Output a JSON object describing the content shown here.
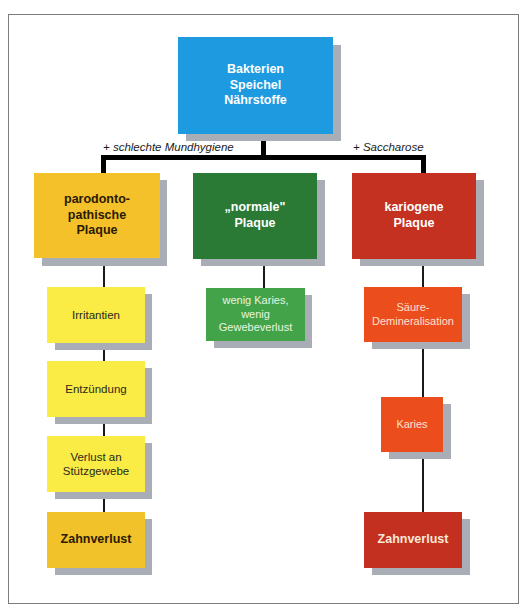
{
  "diagram": {
    "type": "flowchart",
    "colors": {
      "root": "#1d9ae0",
      "yellow_main": "#f4c12a",
      "yellow_light": "#fbeb45",
      "yellow_end": "#f2c22b",
      "green_main": "#2a7a36",
      "green_light": "#42a349",
      "red_main": "#c43120",
      "orange": "#ec4d1d",
      "red_end": "#c3301f",
      "shadow": "#a9aeb6",
      "frame": "#7c7c7c"
    },
    "root": {
      "label": "Bakterien\nSpeichel\nNährstoffe"
    },
    "edge_labels": {
      "left": "+ schlechte Mundhygiene",
      "right": "+ Saccharose"
    },
    "columns": [
      {
        "main": {
          "label": "parodonto-\npathische\nPlaque"
        },
        "steps": [
          {
            "label": "Irritantien"
          },
          {
            "label": "Entzündung"
          },
          {
            "label": "Verlust  an\nStützgewebe"
          },
          {
            "label": "Zahnverlust"
          }
        ]
      },
      {
        "main": {
          "label": "„normale\"\nPlaque"
        },
        "steps": [
          {
            "label": "wenig  Karies,\nwenig\nGewebeverlust"
          }
        ]
      },
      {
        "main": {
          "label": "kariogene\nPlaque"
        },
        "steps": [
          {
            "label": "Säure-\nDemineralisation"
          },
          {
            "label": "Karies"
          },
          {
            "label": "Zahnverlust"
          }
        ]
      }
    ]
  }
}
